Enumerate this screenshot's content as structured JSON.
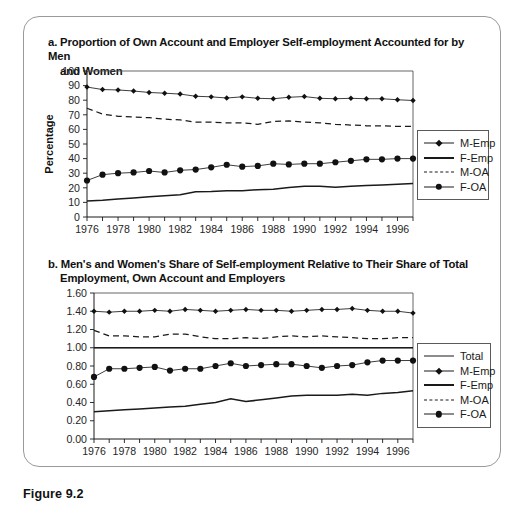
{
  "figure": {
    "caption": "Figure 9.2"
  },
  "panel_a": {
    "label": "a.",
    "title_line1": "a. Proportion of Own Account and Employer Self-employment Accounted for by Men",
    "title_line2": "and Women",
    "y_axis_title": "Percentage",
    "legend": [
      {
        "label": "M-Emp",
        "style": "line-diamond"
      },
      {
        "label": "F-Emp",
        "style": "line-thick"
      },
      {
        "label": "M-OA",
        "style": "dashed"
      },
      {
        "label": "F-OA",
        "style": "line-circle"
      }
    ]
  },
  "panel_b": {
    "label": "b.",
    "title_line1": "b. Men's and Women's Share of Self-employment Relative to Their Share of Total",
    "title_line2": "Employment, Own Account and Employers",
    "legend": [
      {
        "label": "Total",
        "style": "line-thin"
      },
      {
        "label": "M-Emp",
        "style": "line-diamond"
      },
      {
        "label": "F-Emp",
        "style": "line-thick"
      },
      {
        "label": "M-OA",
        "style": "dashed"
      },
      {
        "label": "F-OA",
        "style": "line-circle"
      }
    ]
  },
  "chart_data": [
    {
      "type": "line",
      "id": "panel-a",
      "title": "a. Proportion of Own Account and Employer Self-employment Accounted for by Men and Women",
      "xlabel": "",
      "ylabel": "Percentage",
      "ylim": [
        0,
        100
      ],
      "ytick_labels": [
        "0",
        "10",
        "20",
        "30",
        "40",
        "50",
        "60",
        "70",
        "80",
        "90",
        "100"
      ],
      "yticks": [
        0,
        10,
        20,
        30,
        40,
        50,
        60,
        70,
        80,
        90,
        100
      ],
      "x": [
        1976,
        1977,
        1978,
        1979,
        1980,
        1981,
        1982,
        1983,
        1984,
        1985,
        1986,
        1987,
        1988,
        1989,
        1990,
        1991,
        1992,
        1993,
        1994,
        1995,
        1996,
        1997
      ],
      "xtick_labels": [
        "1976",
        "1978",
        "1980",
        "1982",
        "1984",
        "1986",
        "1988",
        "1990",
        "1992",
        "1994",
        "1996"
      ],
      "xlim": [
        1976,
        1997
      ],
      "grid": false,
      "legend_position": "right",
      "series": [
        {
          "name": "M-Emp",
          "marker": "diamond",
          "linestyle": "solid",
          "values": [
            89.0,
            87.3,
            87.0,
            86.3,
            85.3,
            84.8,
            84.2,
            82.7,
            82.3,
            81.5,
            82.3,
            81.3,
            81.0,
            82.0,
            82.5,
            81.3,
            81.0,
            81.3,
            81.0,
            81.0,
            80.3,
            79.8,
            79.0,
            78.8,
            78.0,
            76.5
          ]
        },
        {
          "name": "F-Emp",
          "marker": "none",
          "linestyle": "solid",
          "values": [
            11.0,
            11.5,
            12.3,
            13.0,
            13.8,
            14.5,
            15.3,
            17.3,
            17.5,
            18.0,
            18.0,
            18.7,
            19.0,
            20.2,
            21.0,
            21.0,
            20.3,
            21.0,
            21.5,
            22.0,
            22.5,
            23.0,
            23.5,
            23.8,
            24.0,
            24.5
          ]
        },
        {
          "name": "M-OA",
          "marker": "none",
          "linestyle": "dashed",
          "values": [
            74.5,
            70.5,
            69.0,
            68.5,
            68.0,
            67.0,
            66.5,
            65.0,
            65.0,
            64.5,
            64.5,
            63.5,
            65.5,
            65.8,
            65.0,
            64.5,
            63.5,
            63.0,
            62.5,
            62.5,
            62.0,
            62.0,
            61.5,
            61.8,
            61.5,
            61.0
          ]
        },
        {
          "name": "F-OA",
          "marker": "circle",
          "linestyle": "solid",
          "values": [
            25.0,
            29.0,
            30.0,
            30.5,
            31.5,
            30.5,
            32.0,
            32.5,
            34.0,
            35.8,
            34.5,
            35.0,
            36.5,
            36.0,
            36.5,
            36.5,
            37.5,
            38.5,
            39.5,
            39.5,
            40.0,
            40.0,
            40.2,
            40.2,
            40.3,
            40.3
          ]
        }
      ]
    },
    {
      "type": "line",
      "id": "panel-b",
      "title": "b. Men's and Women's Share of Self-employment Relative to Their Share of Total Employment, Own Account and Employers",
      "xlabel": "",
      "ylabel": "",
      "ylim": [
        0.0,
        1.6
      ],
      "ytick_labels": [
        "0.00",
        "0.20",
        "0.40",
        "0.60",
        "0.80",
        "1.00",
        "1.20",
        "1.40",
        "1.60"
      ],
      "yticks": [
        0.0,
        0.2,
        0.4,
        0.6,
        0.8,
        1.0,
        1.2,
        1.4,
        1.6
      ],
      "x": [
        1976,
        1977,
        1978,
        1979,
        1980,
        1981,
        1982,
        1983,
        1984,
        1985,
        1986,
        1987,
        1988,
        1989,
        1990,
        1991,
        1992,
        1993,
        1994,
        1995,
        1996,
        1997
      ],
      "xtick_labels": [
        "1976",
        "1978",
        "1980",
        "1982",
        "1984",
        "1986",
        "1988",
        "1990",
        "1992",
        "1994",
        "1996"
      ],
      "xlim": [
        1976,
        1997
      ],
      "grid": false,
      "legend_position": "right",
      "series": [
        {
          "name": "Total",
          "marker": "none",
          "linestyle": "solid",
          "values": [
            1.0,
            1.0,
            1.0,
            1.0,
            1.0,
            1.0,
            1.0,
            1.0,
            1.0,
            1.0,
            1.0,
            1.0,
            1.0,
            1.0,
            1.0,
            1.0,
            1.0,
            1.0,
            1.0,
            1.0,
            1.0,
            1.0
          ]
        },
        {
          "name": "M-Emp",
          "marker": "diamond",
          "linestyle": "solid",
          "values": [
            1.4,
            1.39,
            1.4,
            1.4,
            1.41,
            1.4,
            1.42,
            1.41,
            1.4,
            1.41,
            1.42,
            1.41,
            1.41,
            1.4,
            1.41,
            1.42,
            1.42,
            1.43,
            1.41,
            1.4,
            1.4,
            1.38
          ]
        },
        {
          "name": "F-Emp",
          "marker": "none",
          "linestyle": "solid",
          "values": [
            0.3,
            0.31,
            0.32,
            0.33,
            0.34,
            0.35,
            0.36,
            0.38,
            0.4,
            0.44,
            0.41,
            0.43,
            0.45,
            0.47,
            0.48,
            0.48,
            0.48,
            0.49,
            0.48,
            0.5,
            0.51,
            0.53
          ]
        },
        {
          "name": "M-OA",
          "marker": "none",
          "linestyle": "dashed",
          "values": [
            1.19,
            1.13,
            1.13,
            1.12,
            1.12,
            1.15,
            1.15,
            1.12,
            1.1,
            1.1,
            1.11,
            1.1,
            1.12,
            1.13,
            1.12,
            1.13,
            1.12,
            1.11,
            1.1,
            1.1,
            1.11,
            1.11
          ]
        },
        {
          "name": "F-OA",
          "marker": "circle",
          "linestyle": "solid",
          "values": [
            0.68,
            0.77,
            0.77,
            0.78,
            0.79,
            0.75,
            0.77,
            0.77,
            0.8,
            0.83,
            0.8,
            0.81,
            0.82,
            0.82,
            0.8,
            0.78,
            0.8,
            0.81,
            0.84,
            0.86,
            0.86,
            0.86
          ]
        }
      ]
    }
  ]
}
